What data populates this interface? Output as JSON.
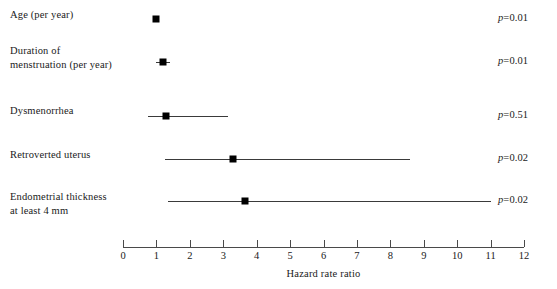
{
  "chart_data": {
    "type": "scatter",
    "subtype": "forest-plot",
    "title": "",
    "xlabel": "Hazard rate ratio",
    "ylabel": "",
    "xlim": [
      0,
      12
    ],
    "xticks": [
      "0",
      "1",
      "2",
      "3",
      "4",
      "5",
      "6",
      "7",
      "8",
      "9",
      "10",
      "11",
      "12"
    ],
    "grid": false,
    "legend": "none",
    "annotations_column": "p-value",
    "rows": [
      {
        "label_line1": "Age (per year)",
        "label_line2": "",
        "estimate": 1.0,
        "ci_low": 1.0,
        "ci_high": 1.0,
        "pvalue_label": "=0.01",
        "pvalue": 0.01
      },
      {
        "label_line1": "Duration of",
        "label_line2": "menstruation (per year)",
        "estimate": 1.2,
        "ci_low": 1.0,
        "ci_high": 1.4,
        "pvalue_label": "=0.01",
        "pvalue": 0.01
      },
      {
        "label_line1": "Dysmenorrhea",
        "label_line2": "",
        "estimate": 1.3,
        "ci_low": 0.75,
        "ci_high": 3.15,
        "pvalue_label": "=0.51",
        "pvalue": 0.51
      },
      {
        "label_line1": "Retroverted uterus",
        "label_line2": "",
        "estimate": 3.3,
        "ci_low": 1.25,
        "ci_high": 8.6,
        "pvalue_label": "=0.02",
        "pvalue": 0.02
      },
      {
        "label_line1": "Endometrial thickness",
        "label_line2": "at least 4 mm",
        "estimate": 3.65,
        "ci_low": 1.35,
        "ci_high": 11.0,
        "pvalue_label": "=0.02",
        "pvalue": 0.02
      }
    ],
    "pvalue_prefix": "p",
    "colors": {
      "marker": "#000000",
      "ci_line": "#3a3a3a",
      "axis": "#4a4a4a",
      "text": "#1a1a1a",
      "background": "#ffffff"
    }
  }
}
